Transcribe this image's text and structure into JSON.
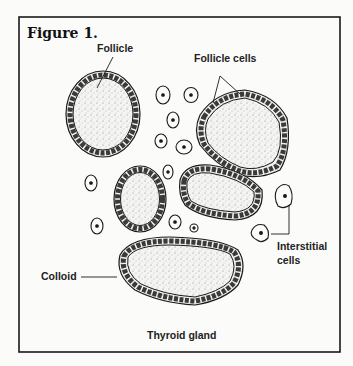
{
  "figure": {
    "title": "Figure 1.",
    "caption": "Thyroid gland",
    "labels": {
      "follicle": "Follicle",
      "follicle_cells": "Follicle cells",
      "colloid": "Colloid",
      "interstitial_line1": "Interstitial",
      "interstitial_line2": "cells"
    }
  },
  "colors": {
    "background": "#fbfbf9",
    "ink": "#1a1a1a",
    "colloid_fill": "#dcdcd8"
  }
}
